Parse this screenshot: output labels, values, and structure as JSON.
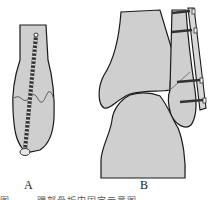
{
  "figure": {
    "panels": [
      {
        "id": "A",
        "label": "A",
        "description": "Distal bone with oblique fracture line fixed by single long lag screw inserted from the tip"
      },
      {
        "id": "B",
        "label": "B",
        "description": "Ankle joint with lateral malleolus fracture fixed by a lateral plate and four screws"
      }
    ],
    "caption": "图 ……  踝部骨折内固定示意图",
    "colors": {
      "bone_fill": "#cfcfcf",
      "outline": "#1a1a1a",
      "screw": "#333333",
      "plate": "#d8d8d8"
    }
  }
}
